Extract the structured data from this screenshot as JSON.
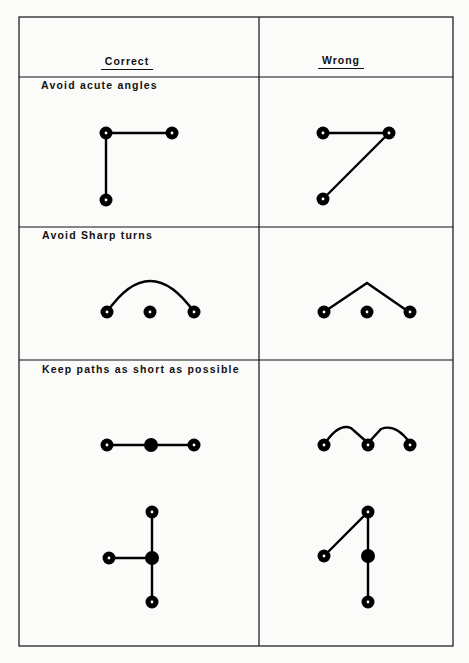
{
  "table": {
    "headers": {
      "correct": "Correct",
      "wrong": "Wrong"
    },
    "rows": [
      {
        "label": "Avoid  acute angles"
      },
      {
        "label": "Avoid  Sharp  turns"
      },
      {
        "label": "Keep  paths  as  short  as  possible"
      }
    ]
  },
  "colors": {
    "ink": "#111111",
    "paper": "#fbfbfa"
  }
}
